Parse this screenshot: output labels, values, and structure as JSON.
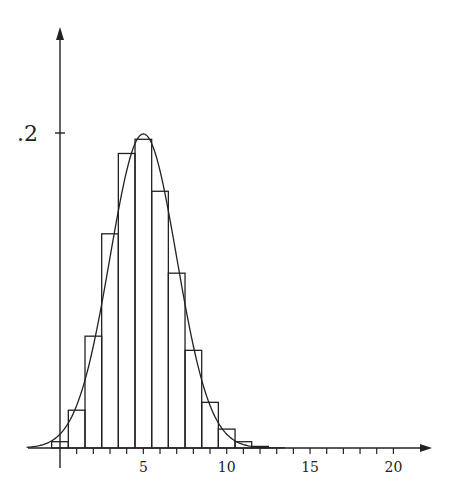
{
  "chart_data": {
    "type": "bar",
    "title": "",
    "subtitle": "",
    "xlabel": "",
    "ylabel": "",
    "categories": [
      0,
      1,
      2,
      3,
      4,
      5,
      6,
      7,
      8,
      9,
      10,
      11,
      12
    ],
    "series": [
      {
        "name": "binomial probabilities",
        "type": "bar",
        "values": [
          0.004,
          0.024,
          0.071,
          0.136,
          0.187,
          0.196,
          0.163,
          0.111,
          0.062,
          0.029,
          0.012,
          0.004,
          0.001
        ]
      },
      {
        "name": "normal approximation",
        "type": "line",
        "mean": 5,
        "sd": 2,
        "peak": 0.1995
      }
    ],
    "x_ticks": [
      5,
      10,
      15,
      20
    ],
    "x_tick_labels": [
      "5",
      "10",
      "15",
      "20"
    ],
    "x_minor_ticks_every": 1,
    "y_ticks": [
      0.2
    ],
    "y_tick_labels": [
      ".2"
    ],
    "xlim": [
      -2,
      22
    ],
    "ylim": [
      0,
      0.26
    ],
    "grid": false,
    "legend": null
  },
  "axis": {
    "y_tick_label": ".2",
    "x_tick_labels": [
      "5",
      "10",
      "15",
      "20"
    ]
  }
}
